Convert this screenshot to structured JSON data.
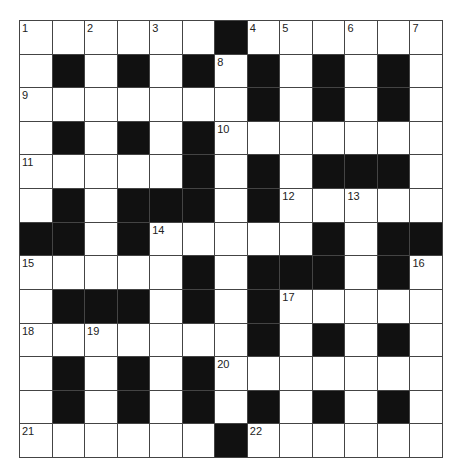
{
  "puzzle": {
    "rows": 13,
    "cols": 13,
    "layout": [
      "......#......",
      ".#.#.#.#.#.#.",
      ".......#.#.#.",
      ".#.#.#.......",
      ".....#.#.###.",
      ".#.###.#.....",
      "##.#.....#.##",
      ".....#.###.#.",
      ".###.#.#.....",
      ".......#.#.#.",
      ".#.#.#.......",
      ".#.#.#.#.#.#.",
      "......#......"
    ],
    "numbers": [
      {
        "row": 0,
        "col": 0,
        "n": "1"
      },
      {
        "row": 0,
        "col": 2,
        "n": "2"
      },
      {
        "row": 0,
        "col": 4,
        "n": "3"
      },
      {
        "row": 0,
        "col": 7,
        "n": "4"
      },
      {
        "row": 0,
        "col": 8,
        "n": "5"
      },
      {
        "row": 0,
        "col": 10,
        "n": "6"
      },
      {
        "row": 0,
        "col": 12,
        "n": "7"
      },
      {
        "row": 1,
        "col": 6,
        "n": "8"
      },
      {
        "row": 2,
        "col": 0,
        "n": "9"
      },
      {
        "row": 3,
        "col": 6,
        "n": "10"
      },
      {
        "row": 4,
        "col": 0,
        "n": "11"
      },
      {
        "row": 5,
        "col": 8,
        "n": "12"
      },
      {
        "row": 5,
        "col": 10,
        "n": "13"
      },
      {
        "row": 6,
        "col": 4,
        "n": "14"
      },
      {
        "row": 7,
        "col": 0,
        "n": "15"
      },
      {
        "row": 7,
        "col": 12,
        "n": "16"
      },
      {
        "row": 8,
        "col": 8,
        "n": "17"
      },
      {
        "row": 9,
        "col": 0,
        "n": "18"
      },
      {
        "row": 9,
        "col": 2,
        "n": "19"
      },
      {
        "row": 10,
        "col": 6,
        "n": "20"
      },
      {
        "row": 12,
        "col": 0,
        "n": "21"
      },
      {
        "row": 12,
        "col": 7,
        "n": "22"
      }
    ],
    "colors": {
      "block": "#111111",
      "cell": "#ffffff",
      "line": "#444444"
    }
  }
}
